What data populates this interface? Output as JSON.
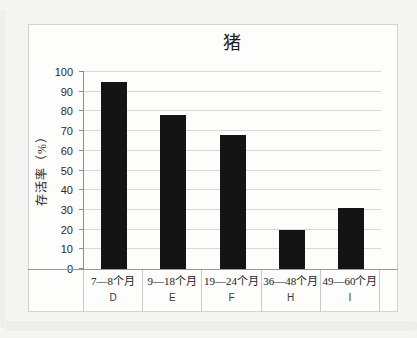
{
  "chart_data": {
    "type": "bar",
    "title": "猪",
    "ylabel": "存活率（%）",
    "xlabel": "",
    "ylim": [
      0,
      100
    ],
    "yticks": [
      0,
      10,
      20,
      30,
      40,
      50,
      60,
      70,
      80,
      90,
      100
    ],
    "grid": true,
    "categories": [
      "7—8个月",
      "9—18个月",
      "19—24个月",
      "36—48个月",
      "49—60个月"
    ],
    "group_labels": [
      "D",
      "E",
      "F",
      "H",
      "I"
    ],
    "values": [
      95,
      78,
      68,
      20,
      31
    ],
    "bar_color": "#141414",
    "gridline_color": "#d8d8d6",
    "axis_color": "#8c8c8c",
    "legend": "none"
  }
}
